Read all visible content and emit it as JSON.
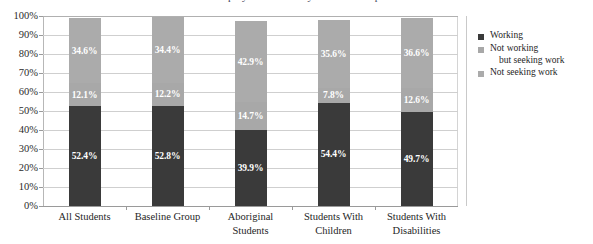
{
  "title_remnant": "Employment Status by Student Group",
  "chart_data": {
    "type": "bar",
    "subtype": "100% stacked column",
    "title": "",
    "xlabel": "",
    "ylabel": "",
    "ylim": [
      0,
      100
    ],
    "ytick_labels": [
      "100%",
      "90%",
      "80%",
      "70%",
      "60%",
      "50%",
      "40%",
      "30%",
      "20%",
      "10%",
      "0%"
    ],
    "ytick_values": [
      100,
      90,
      80,
      70,
      60,
      50,
      40,
      30,
      20,
      10,
      0
    ],
    "grid": true,
    "legend_position": "right",
    "categories": [
      "All Students",
      "Baseline Group",
      "Aboriginal Students",
      "Students With Children",
      "Students With Disabilities"
    ],
    "category_lines": [
      [
        "All Students"
      ],
      [
        "Baseline Group"
      ],
      [
        "Aboriginal",
        "Students"
      ],
      [
        "Students With",
        "Children"
      ],
      [
        "Students With",
        "Disabilities"
      ]
    ],
    "series": [
      {
        "name": "Working",
        "color": "#3A3A3A",
        "values": [
          52.4,
          52.8,
          39.9,
          54.4,
          49.7
        ],
        "labels": [
          "52.4%",
          "52.8%",
          "39.9%",
          "54.4%",
          "49.7%"
        ]
      },
      {
        "name": "Not working but seeking work",
        "legend_line1": "Not working",
        "legend_line2": "but seeking work",
        "color": "#A8A8A8",
        "values": [
          12.1,
          12.2,
          14.7,
          7.8,
          12.6
        ],
        "labels": [
          "12.1%",
          "12.2%",
          "14.7%",
          "7.8%",
          "12.6%"
        ]
      },
      {
        "name": "Not seeking work",
        "legend_line1": "Not seeking work",
        "legend_line2": "",
        "color": "#ABABAB",
        "values": [
          34.6,
          34.4,
          42.9,
          35.6,
          36.6
        ],
        "labels": [
          "34.6%",
          "34.4%",
          "42.9%",
          "35.6%",
          "36.6%"
        ]
      }
    ]
  }
}
